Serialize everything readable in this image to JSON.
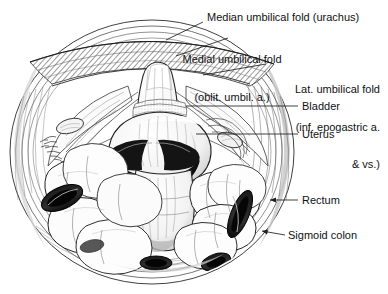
{
  "figure": {
    "view": "abdominopelvic cavity viewed from above",
    "background_color": "#ffffff",
    "ink_color": "#1a1a1a",
    "medium": "pen-and-ink stipple and hatch line drawing"
  },
  "labels": [
    {
      "id": "median-umbilical-fold",
      "name": "median-umbilical-fold-label",
      "lines": [
        "Median umbilical fold (urachus)"
      ],
      "x": 207,
      "y": 11,
      "align": "left",
      "leader": {
        "from_x": 203,
        "from_y": 22,
        "to_x": 166,
        "to_y": 40
      }
    },
    {
      "id": "medial-umbilical-fold",
      "name": "medial-umbilical-fold-label",
      "lines": [
        "Medial umbilical fold",
        "(oblit. umbil. a.)"
      ],
      "x": 232,
      "y": 28,
      "align": "center",
      "leader": {
        "from_x": 228,
        "from_y": 38,
        "to_x": 176,
        "to_y": 56
      }
    },
    {
      "id": "lat-umbilical-fold",
      "name": "lateral-umbilical-fold-label",
      "lines": [
        "Lat. umbilical fold",
        "(inf. epogastric a.",
        "& vs.)"
      ],
      "x": 270,
      "y": 58,
      "align": "right",
      "leader": {
        "from_x": 266,
        "from_y": 64,
        "to_x": 203,
        "to_y": 75
      }
    },
    {
      "id": "bladder",
      "name": "bladder-label",
      "lines": [
        "Bladder"
      ],
      "x": 302,
      "y": 100,
      "align": "left",
      "leader": {
        "from_x": 298,
        "from_y": 106,
        "to_x": 186,
        "to_y": 106
      }
    },
    {
      "id": "uterus",
      "name": "uterus-label",
      "lines": [
        "Uterus"
      ],
      "x": 302,
      "y": 128,
      "align": "left",
      "leader": {
        "from_x": 298,
        "from_y": 134,
        "to_x": 196,
        "to_y": 134
      }
    },
    {
      "id": "rectum",
      "name": "rectum-label",
      "lines": [
        "Rectum"
      ],
      "x": 302,
      "y": 194,
      "align": "left",
      "leader": {
        "from_x": 298,
        "from_y": 200,
        "to_x": 270,
        "to_y": 200
      }
    },
    {
      "id": "sigmoid-colon",
      "name": "sigmoid-colon-label",
      "lines": [
        "Sigmoid colon"
      ],
      "x": 288,
      "y": 229,
      "align": "left",
      "leader": {
        "from_x": 285,
        "from_y": 235,
        "to_x": 262,
        "to_y": 231
      }
    }
  ],
  "structures": [
    {
      "id": "abdominal-wall",
      "name": "abdominal-wall-ring"
    },
    {
      "id": "peritoneum-hatching",
      "name": "peritoneal-hatching"
    },
    {
      "id": "uterus-body",
      "name": "uterus-body"
    },
    {
      "id": "bladder-dome",
      "name": "bladder-dome"
    },
    {
      "id": "broad-ligament-left",
      "name": "broad-ligament-left"
    },
    {
      "id": "broad-ligament-right",
      "name": "broad-ligament-right"
    },
    {
      "id": "rectum-loop",
      "name": "rectum-loop"
    },
    {
      "id": "sigmoid-loops",
      "name": "sigmoid-colon-loops"
    },
    {
      "id": "small-bowel-loops",
      "name": "small-bowel-loops"
    },
    {
      "id": "cut-bowel-left",
      "name": "cut-bowel-end-left"
    },
    {
      "id": "cut-bowel-right",
      "name": "cut-bowel-end-right"
    },
    {
      "id": "ovary-left",
      "name": "ovary-left"
    },
    {
      "id": "ovary-right",
      "name": "ovary-right"
    },
    {
      "id": "fimbriae",
      "name": "fimbriae-left"
    }
  ]
}
